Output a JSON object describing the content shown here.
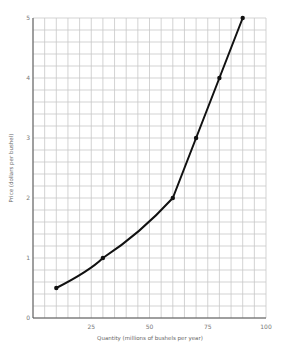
{
  "chart_data": {
    "type": "line",
    "title": "",
    "xlabel": "Quantity (millions of bushels per year)",
    "ylabel": "Price (dollars per bushel)",
    "xlim": [
      0,
      100
    ],
    "ylim": [
      0,
      5
    ],
    "x_ticks": [
      0,
      25,
      50,
      75,
      100
    ],
    "y_ticks": [
      1,
      2,
      3,
      4,
      5
    ],
    "grid": true,
    "grid_x_step": 5,
    "grid_y_step": 0.2,
    "series": [
      {
        "name": "Supply",
        "points": [
          {
            "x": 10,
            "y": 0.5
          },
          {
            "x": 30,
            "y": 1.0
          },
          {
            "x": 60,
            "y": 2.0
          },
          {
            "x": 70,
            "y": 3.0
          },
          {
            "x": 80,
            "y": 4.0
          },
          {
            "x": 90,
            "y": 5.0
          }
        ]
      }
    ],
    "colors": {
      "line": "#111111",
      "grid": "#c8c8c8",
      "axis": "#555555"
    }
  }
}
